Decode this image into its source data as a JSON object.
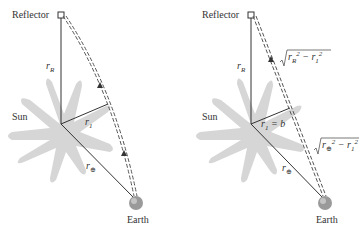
{
  "left_panel": {
    "reflector_label": "Reflector",
    "sun_label": "Sun",
    "earth_label": "Earth",
    "r_R": "r",
    "r_R_sub": "R",
    "r_1": "r",
    "r_1_sub": "1",
    "r_earth": "r",
    "r_earth_sub": "⊕"
  },
  "right_panel": {
    "reflector_label": "Reflector",
    "sun_label": "Sun",
    "earth_label": "Earth",
    "r_R": "r",
    "r_R_sub": "R",
    "r_1_eq": "r",
    "r_1_sub": "1",
    "r_1_rhs": " = b",
    "r_earth": "r",
    "r_earth_sub": "⊕",
    "upper_segment_formula": "√(r_R² − r_1²)",
    "lower_segment_formula": "√(r_⊕² − r_1²)"
  },
  "colors": {
    "sun": "#d4d4d4",
    "lines": "#333333",
    "earth": "#9a9a9a"
  }
}
